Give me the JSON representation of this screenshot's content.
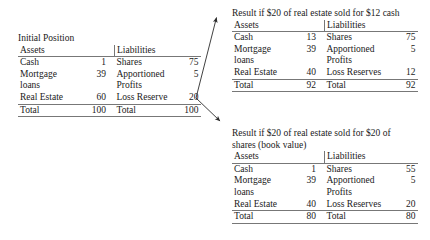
{
  "diagram": {
    "title_text": "Balance sheet effects of selling real estate",
    "columns": {
      "assets_header": "Assets",
      "liabilities_header": "Liabilities"
    }
  },
  "initial": {
    "title": "Initial Position",
    "assets_header": "Assets",
    "liabilities_header": "Liabilities",
    "assets": [
      {
        "label": "Cash",
        "value": "1"
      },
      {
        "label": "Mortgage loans",
        "value": "39"
      },
      {
        "label": "Real Estate",
        "value": "60"
      }
    ],
    "liabilities": [
      {
        "label": "Shares",
        "value": "75"
      },
      {
        "label": "Apportioned Profits",
        "value": "5"
      },
      {
        "label": "Loss Reserve",
        "value": "20"
      }
    ],
    "assets_total_label": "Total",
    "assets_total": "100",
    "liabilities_total_label": "Total",
    "liabilities_total": "100"
  },
  "case_cash": {
    "title": "Result if $20 of real estate sold for $12 cash",
    "assets_header": "Assets",
    "liabilities_header": "Liabilities",
    "assets": [
      {
        "label": "Cash",
        "value": "13"
      },
      {
        "label": "Mortgage loans",
        "value": "39"
      },
      {
        "label": "Real Estate",
        "value": "40"
      }
    ],
    "liabilities": [
      {
        "label": "Shares",
        "value": "75"
      },
      {
        "label": "Apportioned Profits",
        "value": "5"
      },
      {
        "label": "Loss Reserves",
        "value": "12"
      }
    ],
    "assets_total_label": "Total",
    "assets_total": "92",
    "liabilities_total_label": "Total",
    "liabilities_total": "92"
  },
  "case_shares": {
    "title": "Result if $20 of real estate sold for $20 of shares (book value)",
    "assets_header": "Assets",
    "liabilities_header": "Liabilities",
    "assets": [
      {
        "label": "Cash",
        "value": "1"
      },
      {
        "label": "Mortgage loans",
        "value": "39"
      },
      {
        "label": "Real Estate",
        "value": "40"
      }
    ],
    "liabilities": [
      {
        "label": "Shares",
        "value": "55"
      },
      {
        "label": "Apportioned Profits",
        "value": "5"
      },
      {
        "label": "Loss Reserves",
        "value": "20"
      }
    ],
    "assets_total_label": "Total",
    "assets_total": "80",
    "liabilities_total_label": "Total",
    "liabilities_total": "80"
  },
  "arrows": {
    "upper_label": "branch-to-cash-case",
    "lower_label": "branch-to-shares-case",
    "color": "#2b2b2b"
  }
}
